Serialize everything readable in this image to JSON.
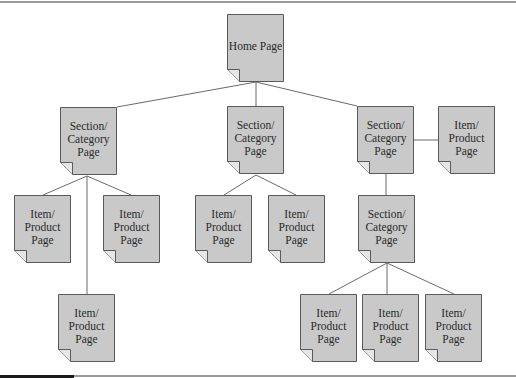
{
  "diagram": {
    "type": "site-hierarchy",
    "colors": {
      "node_fill": "#c9c9c9",
      "node_border": "#5a5a5a",
      "line": "#6a6a6a",
      "corner_fill": "#e6e6e6"
    },
    "nodes": [
      {
        "id": "home",
        "label": "Home Page",
        "x": 227,
        "y": 14
      },
      {
        "id": "section-left",
        "label": "Section/\nCategory\nPage",
        "x": 60,
        "y": 107
      },
      {
        "id": "section-middle",
        "label": "Section/\nCategory\nPage",
        "x": 227,
        "y": 106
      },
      {
        "id": "section-right",
        "label": "Section/\nCategory\nPage",
        "x": 357,
        "y": 106
      },
      {
        "id": "item-right-top",
        "label": "Item/\nProduct\nPage",
        "x": 438,
        "y": 106
      },
      {
        "id": "item-left-1",
        "label": "Item/\nProduct\nPage",
        "x": 14,
        "y": 195
      },
      {
        "id": "item-left-2",
        "label": "Item/\nProduct\nPage",
        "x": 103,
        "y": 195
      },
      {
        "id": "item-left-3",
        "label": "Item/\nProduct\nPage",
        "x": 58,
        "y": 294
      },
      {
        "id": "item-middle-1",
        "label": "Item/\nProduct\nPage",
        "x": 195,
        "y": 195
      },
      {
        "id": "item-middle-2",
        "label": "Item/\nProduct\nPage",
        "x": 268,
        "y": 195
      },
      {
        "id": "section-sub",
        "label": "Section/\nCategory\nPage",
        "x": 358,
        "y": 195
      },
      {
        "id": "item-sub-1",
        "label": "Item/\nProduct\nPage",
        "x": 300,
        "y": 294
      },
      {
        "id": "item-sub-2",
        "label": "Item/\nProduct\nPage",
        "x": 362,
        "y": 294
      },
      {
        "id": "item-sub-3",
        "label": "Item/\nProduct\nPage",
        "x": 425,
        "y": 294
      }
    ],
    "edges": [
      [
        "home",
        "section-left"
      ],
      [
        "home",
        "section-middle"
      ],
      [
        "home",
        "section-right"
      ],
      [
        "section-right",
        "item-right-top"
      ],
      [
        "section-left",
        "item-left-1"
      ],
      [
        "section-left",
        "item-left-2"
      ],
      [
        "section-left",
        "item-left-3"
      ],
      [
        "section-middle",
        "item-middle-1"
      ],
      [
        "section-middle",
        "item-middle-2"
      ],
      [
        "section-right",
        "section-sub"
      ],
      [
        "section-sub",
        "item-sub-1"
      ],
      [
        "section-sub",
        "item-sub-2"
      ],
      [
        "section-sub",
        "item-sub-3"
      ]
    ]
  }
}
